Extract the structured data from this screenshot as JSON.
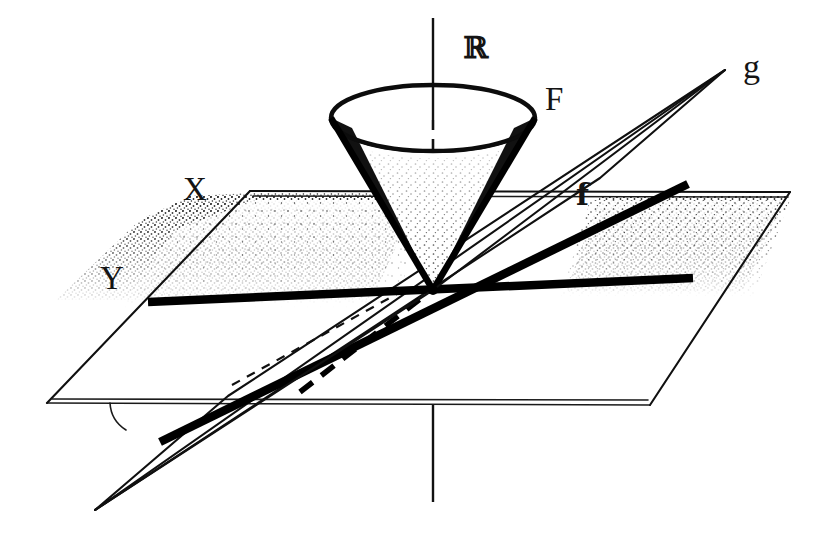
{
  "figure": {
    "background_color": "#ffffff",
    "ink_color": "#111111",
    "width": 834,
    "height": 538
  },
  "labels": [
    {
      "id": "axis-r",
      "text": "ℝ",
      "x": 463,
      "y": 58,
      "role": "vertical-axis-label",
      "style": "blackboard-bold"
    },
    {
      "id": "cone-f",
      "text": "F",
      "x": 545,
      "y": 110,
      "role": "cone-label",
      "style": "serif-capital"
    },
    {
      "id": "plane-x",
      "text": "X",
      "x": 183,
      "y": 200,
      "role": "plane-label",
      "style": "serif-capital"
    },
    {
      "id": "plane-y",
      "text": "Y",
      "x": 100,
      "y": 289,
      "role": "plane-label",
      "style": "serif-capital"
    },
    {
      "id": "map-f",
      "text": "f",
      "x": 576,
      "y": 205,
      "role": "map-label",
      "style": "bold-serif-lower"
    },
    {
      "id": "map-g",
      "text": "g",
      "x": 743,
      "y": 78,
      "role": "map-label",
      "style": "serif-lower"
    }
  ],
  "geometry": {
    "origin": {
      "x": 433,
      "y": 290
    },
    "vertical_axis": {
      "top": {
        "x": 433,
        "y": 18
      },
      "bottom": {
        "x": 433,
        "y": 500
      },
      "solid_segments": [
        {
          "from_y": 18,
          "to_y": 118
        },
        {
          "from_y": 403,
          "to_y": 500
        }
      ],
      "dashed_segments": [
        {
          "from_y": 118,
          "to_y": 290
        },
        {
          "from_y": 290,
          "to_y": 403
        }
      ]
    },
    "cone": {
      "apex": {
        "x": 433,
        "y": 290
      },
      "rim_center": {
        "x": 433,
        "y": 118
      },
      "rim_rx": 102,
      "rim_ry": 33,
      "orientation": "inverted",
      "shaded": true
    },
    "horizontal_plane": {
      "shape": "parallelogram",
      "vertices": [
        {
          "x": 250,
          "y": 191
        },
        {
          "x": 790,
          "y": 192
        },
        {
          "x": 650,
          "y": 405
        },
        {
          "x": 47,
          "y": 403
        }
      ],
      "stipple_shading": "upper band"
    },
    "tilted_plane": {
      "shape": "parallelogram",
      "vertices": [
        {
          "x": 725,
          "y": 70
        },
        {
          "x": 600,
          "y": 178
        },
        {
          "x": 95,
          "y": 510
        },
        {
          "x": 228,
          "y": 396
        }
      ]
    },
    "bold_lines": [
      {
        "id": "line-y-horizontal",
        "from": {
          "x": 148,
          "y": 302
        },
        "to": {
          "x": 693,
          "y": 278
        },
        "weight": "bold"
      },
      {
        "id": "line-f-map",
        "from": {
          "x": 160,
          "y": 442
        },
        "to": {
          "x": 688,
          "y": 184
        },
        "weight": "bold"
      }
    ],
    "thin_lines": [
      {
        "id": "cone-left-generator",
        "from": {
          "x": 331,
          "y": 118
        },
        "to": {
          "x": 433,
          "y": 290
        }
      },
      {
        "id": "cone-right-generator",
        "from": {
          "x": 535,
          "y": 118
        },
        "to": {
          "x": 433,
          "y": 290
        }
      },
      {
        "id": "g-ray",
        "from": {
          "x": 433,
          "y": 290
        },
        "to": {
          "x": 725,
          "y": 70
        }
      },
      {
        "id": "g-ray-lower",
        "from": {
          "x": 433,
          "y": 290
        },
        "to": {
          "x": 95,
          "y": 510
        }
      }
    ],
    "dashed_lines": [
      {
        "id": "hidden-edge-origin-right",
        "from": {
          "x": 433,
          "y": 290
        },
        "to": {
          "x": 580,
          "y": 284
        }
      },
      {
        "id": "hidden-edge-lower-left",
        "from": {
          "x": 240,
          "y": 386
        },
        "to": {
          "x": 420,
          "y": 296
        }
      },
      {
        "id": "hidden-edge-lower-left-2",
        "from": {
          "x": 292,
          "y": 400
        },
        "to": {
          "x": 430,
          "y": 300
        }
      }
    ],
    "angle_arc": {
      "cx": 143,
      "cy": 403,
      "r": 32,
      "note": "small arc at lower-left plane corner"
    }
  }
}
